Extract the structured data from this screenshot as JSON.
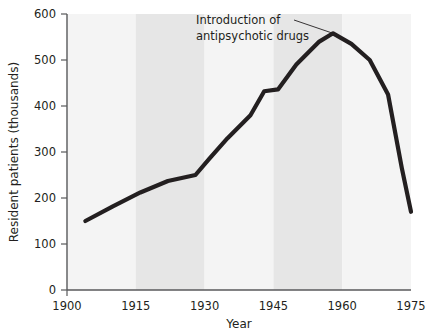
{
  "chart_data": {
    "type": "line",
    "title": "",
    "xlabel": "Year",
    "ylabel": "Resident patients (thousands)",
    "xlim": [
      1900,
      1975
    ],
    "ylim": [
      0,
      600
    ],
    "grid": false,
    "legend": "none",
    "x_ticks": [
      "1900",
      "1915",
      "1930",
      "1945",
      "1960",
      "1975"
    ],
    "y_ticks": [
      "0",
      "100",
      "200",
      "300",
      "400",
      "500",
      "600"
    ],
    "series": [
      {
        "name": "Resident patients",
        "color": "#231f20",
        "x": [
          1904,
          1910,
          1916,
          1922,
          1928,
          1931,
          1935,
          1940,
          1943,
          1946,
          1950,
          1955,
          1958,
          1962,
          1966,
          1970,
          1973,
          1975
        ],
        "values": [
          150,
          182,
          212,
          237,
          250,
          285,
          330,
          380,
          432,
          436,
          490,
          540,
          558,
          535,
          500,
          425,
          265,
          170
        ]
      }
    ],
    "annotations": [
      {
        "text_line1": "Introduction of",
        "text_line2": "antipsychotic drugs",
        "target_x": 1958,
        "target_y": 558
      }
    ],
    "bands": [
      {
        "from": 1900,
        "to": 1915,
        "shade": "light"
      },
      {
        "from": 1915,
        "to": 1930,
        "shade": "dark"
      },
      {
        "from": 1930,
        "to": 1945,
        "shade": "light"
      },
      {
        "from": 1945,
        "to": 1960,
        "shade": "dark"
      },
      {
        "from": 1960,
        "to": 1975,
        "shade": "light"
      }
    ],
    "colors": {
      "line": "#231f20",
      "band_light": "#f4f4f4",
      "band_dark": "#e6e6e6",
      "axis": "#58595b",
      "text": "#231f20",
      "background": "#ffffff"
    }
  }
}
